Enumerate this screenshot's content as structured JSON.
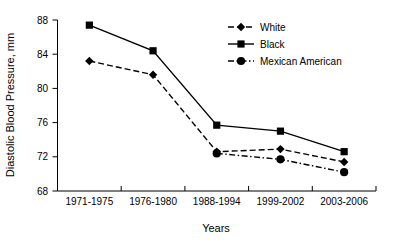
{
  "chart_data": {
    "type": "line",
    "title": "",
    "xlabel": "Years",
    "ylabel": "Diastolic Blood Pressure, mm",
    "categories": [
      "1971-1975",
      "1976-1980",
      "1988-1994",
      "1999-2002",
      "2003-2006"
    ],
    "ylim": [
      68,
      88
    ],
    "yticks": [
      68,
      72,
      76,
      80,
      84,
      88
    ],
    "ytick_labels": [
      "68",
      "72",
      "76",
      "80",
      "84",
      "88"
    ],
    "grid": false,
    "legend_position": "top-right",
    "series": [
      {
        "name": "White",
        "marker": "diamond",
        "line_style": "dashed",
        "color": "#000000",
        "values": [
          83.2,
          81.6,
          72.6,
          72.9,
          71.4
        ]
      },
      {
        "name": "Black",
        "marker": "square",
        "line_style": "solid",
        "color": "#000000",
        "values": [
          87.4,
          84.4,
          75.7,
          75.0,
          72.6
        ]
      },
      {
        "name": "Mexican American",
        "marker": "circle",
        "line_style": "dash-dot",
        "color": "#000000",
        "values": [
          null,
          null,
          72.4,
          71.7,
          70.2
        ]
      }
    ]
  }
}
